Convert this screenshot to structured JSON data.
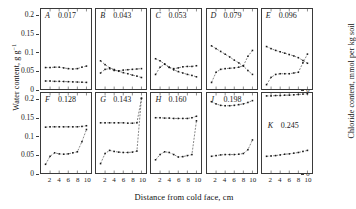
{
  "chart_data": {
    "type": "line",
    "title": "",
    "xlabel": "Distance from cold face, cm",
    "ylabel_left": "Water content, g g",
    "ylabel_left_exp": "-1",
    "ylabel_right": "Chloride content, mmol per kg soil",
    "xlim": [
      0,
      11
    ],
    "ylim_left": [
      0,
      0.22
    ],
    "ylim_right": [
      0,
      4.6
    ],
    "xticks": [
      2,
      4,
      6,
      8,
      10
    ],
    "yticks_left": [
      "0",
      "0.05",
      "0.1",
      "0.15",
      "0.2"
    ],
    "yticks_left_values": [
      0,
      0.05,
      0.1,
      0.15,
      0.2
    ],
    "yticks_right": [
      "0",
      "1",
      "2",
      "3",
      "4"
    ],
    "yticks_right_values": [
      0,
      1,
      2,
      3,
      4
    ],
    "grid": false,
    "legend": "none",
    "series_names": [
      "Water content",
      "Chloride content"
    ],
    "panels": [
      {
        "id": "A",
        "label": "A",
        "value": "0.017",
        "row": 0,
        "col": 0,
        "water": {
          "x": [
            1,
            2,
            3,
            4,
            5,
            6,
            7,
            8,
            9,
            10
          ],
          "y": [
            0.059,
            0.059,
            0.06,
            0.06,
            0.058,
            0.056,
            0.055,
            0.056,
            0.06,
            0.063
          ]
        },
        "chloride": {
          "x": [
            1,
            2,
            3,
            4,
            5,
            6,
            7,
            8,
            9,
            10
          ],
          "y": [
            0.46,
            0.46,
            0.44,
            0.44,
            0.43,
            0.42,
            0.41,
            0.4,
            0.39,
            0.38
          ]
        }
      },
      {
        "id": "B",
        "label": "B",
        "value": "0.043",
        "row": 0,
        "col": 1,
        "water": {
          "x": [
            1,
            2,
            3,
            4,
            5,
            6,
            7,
            8,
            9,
            10
          ],
          "y": [
            0.044,
            0.054,
            0.056,
            0.051,
            0.05,
            0.052,
            0.053,
            0.054,
            0.055,
            0.056
          ]
        },
        "chloride": {
          "x": [
            1,
            2,
            3,
            4,
            5,
            6,
            7,
            8,
            9,
            10
          ],
          "y": [
            1.62,
            1.4,
            1.22,
            1.12,
            1.02,
            0.94,
            0.88,
            0.8,
            0.74,
            0.66
          ]
        }
      },
      {
        "id": "C",
        "label": "C",
        "value": "0.053",
        "row": 0,
        "col": 2,
        "water": {
          "x": [
            1,
            2,
            3,
            4,
            5,
            6,
            7,
            8,
            9,
            10
          ],
          "y": [
            0.04,
            0.06,
            0.068,
            0.06,
            0.056,
            0.058,
            0.061,
            0.062,
            0.062,
            0.064
          ]
        },
        "chloride": {
          "x": [
            1,
            2,
            3,
            4,
            5,
            6,
            7,
            8,
            9,
            10
          ],
          "y": [
            1.74,
            1.62,
            1.44,
            1.24,
            1.1,
            1.0,
            0.92,
            0.84,
            0.78,
            0.7
          ]
        }
      },
      {
        "id": "D",
        "label": "D",
        "value": "0.079",
        "row": 0,
        "col": 3,
        "water": {
          "x": [
            1,
            2,
            3,
            4,
            5,
            6,
            7,
            8,
            9,
            10
          ],
          "y": [
            0.018,
            0.046,
            0.054,
            0.056,
            0.057,
            0.058,
            0.06,
            0.064,
            0.09,
            0.106
          ]
        },
        "chloride": {
          "x": [
            1,
            2,
            3,
            4,
            5,
            6,
            7,
            8,
            9,
            10
          ],
          "y": [
            2.48,
            2.32,
            2.16,
            2.0,
            1.84,
            1.66,
            1.5,
            1.32,
            1.06,
            0.84
          ]
        }
      },
      {
        "id": "E",
        "label": "E",
        "value": "0.096",
        "row": 0,
        "col": 4,
        "water": {
          "x": [
            1,
            2,
            3,
            4,
            5,
            6,
            7,
            8,
            9,
            10
          ],
          "y": [
            0.012,
            0.032,
            0.04,
            0.042,
            0.042,
            0.042,
            0.044,
            0.046,
            0.072,
            0.096
          ]
        },
        "chloride": {
          "x": [
            1,
            2,
            3,
            4,
            5,
            6,
            7,
            8,
            9,
            10
          ],
          "y": [
            2.44,
            2.32,
            2.22,
            2.14,
            2.06,
            1.98,
            1.9,
            1.8,
            1.64,
            1.48
          ]
        }
      },
      {
        "id": "F",
        "label": "F",
        "value": "0.128",
        "row": 1,
        "col": 0,
        "water": {
          "x": [
            1,
            2,
            3,
            4,
            5,
            6,
            7,
            8,
            9,
            10
          ],
          "y": [
            0.126,
            0.127,
            0.127,
            0.127,
            0.127,
            0.127,
            0.127,
            0.127,
            0.128,
            0.13
          ]
        },
        "chloride": {
          "x": [
            1,
            2,
            3,
            4,
            5,
            6,
            7,
            8,
            9,
            10
          ],
          "y": [
            0.5,
            0.96,
            1.16,
            1.1,
            1.08,
            1.1,
            1.16,
            1.22,
            1.8,
            2.5
          ]
        }
      },
      {
        "id": "G",
        "label": "G",
        "value": "0.143",
        "row": 1,
        "col": 1,
        "water": {
          "x": [
            1,
            2,
            3,
            4,
            5,
            6,
            7,
            8,
            9,
            10
          ],
          "y": [
            0.138,
            0.138,
            0.138,
            0.138,
            0.138,
            0.138,
            0.137,
            0.137,
            0.138,
            0.205
          ]
        },
        "chloride": {
          "x": [
            1,
            2,
            3,
            4,
            5,
            6,
            7,
            8,
            9,
            10
          ],
          "y": [
            0.54,
            1.12,
            1.3,
            1.24,
            1.2,
            1.18,
            1.18,
            1.2,
            1.26,
            4.3
          ]
        }
      },
      {
        "id": "H",
        "label": "H",
        "value": "0.160",
        "row": 1,
        "col": 2,
        "water": {
          "x": [
            1,
            2,
            3,
            4,
            5,
            6,
            7,
            8,
            9,
            10
          ],
          "y": [
            0.152,
            0.152,
            0.151,
            0.151,
            0.15,
            0.15,
            0.15,
            0.15,
            0.152,
            0.156
          ]
        },
        "chloride": {
          "x": [
            1,
            2,
            3,
            4,
            5,
            6,
            7,
            8,
            9,
            10
          ],
          "y": [
            0.76,
            1.06,
            1.22,
            1.18,
            1.06,
            0.92,
            0.94,
            1.0,
            1.06,
            3.0
          ]
        }
      },
      {
        "id": "J",
        "label": "J",
        "value": "0.198",
        "row": 1,
        "col": 3,
        "water": {
          "x": [
            1,
            2,
            3,
            4,
            5,
            6,
            7,
            8,
            9,
            10
          ],
          "y": [
            0.196,
            0.19,
            0.186,
            0.185,
            0.185,
            0.186,
            0.188,
            0.19,
            0.194,
            0.199
          ]
        },
        "chloride": {
          "x": [
            1,
            2,
            3,
            4,
            5,
            6,
            7,
            8,
            9,
            10
          ],
          "y": [
            0.96,
            1.0,
            1.04,
            1.06,
            1.06,
            1.06,
            1.08,
            1.12,
            1.34,
            1.9
          ]
        }
      },
      {
        "id": "K",
        "label": "K",
        "value": "0.245",
        "row": 1,
        "col": 4,
        "water": {
          "x": [
            1,
            2,
            3,
            4,
            5,
            6,
            7,
            8,
            9,
            10
          ],
          "y": [
            0.212,
            0.212,
            0.213,
            0.213,
            0.214,
            0.214,
            0.215,
            0.216,
            0.217,
            0.218
          ]
        },
        "chloride": {
          "x": [
            1,
            2,
            3,
            4,
            5,
            6,
            7,
            8,
            9,
            10
          ],
          "y": [
            0.96,
            0.98,
            1.0,
            1.04,
            1.08,
            1.1,
            1.14,
            1.18,
            1.24,
            1.3
          ]
        }
      }
    ]
  },
  "axes": {
    "left_title": "Water content, g g",
    "left_title_exp": "−1",
    "right_title": "Chloride content, mmol per kg soil",
    "x_title": "Distance from cold face, cm"
  }
}
